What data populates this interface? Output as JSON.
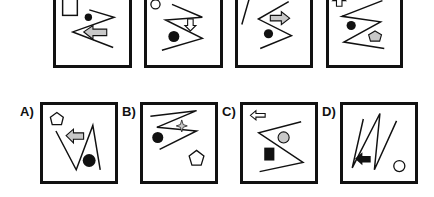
{
  "puzzle": {
    "type": "visual-sequence",
    "sequence_panels": [
      {
        "index": 1,
        "elements": [
          "outline-rectangle",
          "zigzag-left-pointing",
          "black-dot-small",
          "gray-arrow-left"
        ]
      },
      {
        "index": 2,
        "elements": [
          "outline-circle",
          "zigzag-right-pointing",
          "black-dot",
          "outline-arrow-down"
        ]
      },
      {
        "index": 3,
        "elements": [
          "outline-triangle-sliver",
          "zigzag-right-pointing",
          "black-dot",
          "gray-arrow-right"
        ]
      },
      {
        "index": 4,
        "elements": [
          "outline-arrow-up",
          "zigzag-right-pointing",
          "black-dot",
          "gray-pentagon"
        ]
      }
    ],
    "options": [
      {
        "label": "A)",
        "elements": [
          "outline-pentagon",
          "v-zigzag",
          "gray-arrow-left",
          "black-dot"
        ]
      },
      {
        "label": "B)",
        "elements": [
          "zigzag-right-pointing",
          "four-point-star",
          "black-dot",
          "outline-pentagon"
        ]
      },
      {
        "label": "C)",
        "elements": [
          "outline-arrow-left",
          "zigzag-left-pointing",
          "gray-circle",
          "black-square"
        ]
      },
      {
        "label": "D)",
        "elements": [
          "n-zigzag",
          "black-arrow-left",
          "outline-circle"
        ]
      }
    ]
  },
  "colors": {
    "stroke": "#111111",
    "gray_fill": "#c8c8c8",
    "background": "#ffffff"
  }
}
